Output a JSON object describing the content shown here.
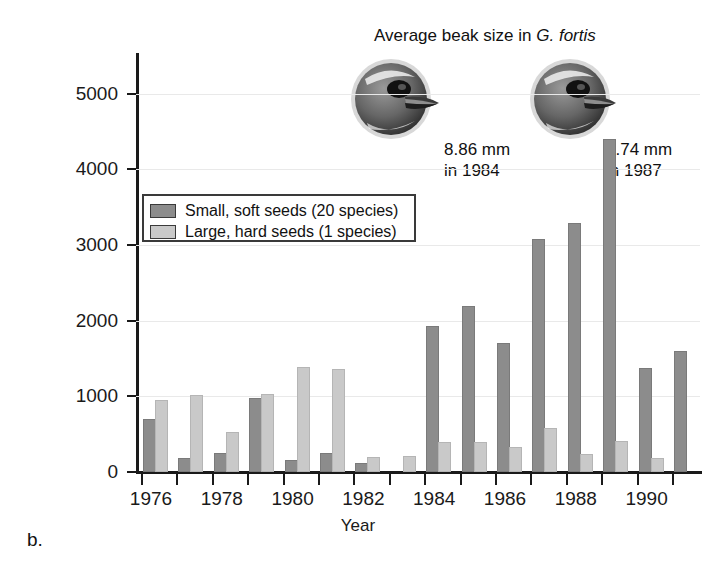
{
  "panel_label": "b.",
  "legend": {
    "items": [
      {
        "key": "small",
        "label": "Small, soft seeds (20 species)",
        "color": "#8c8c8c"
      },
      {
        "key": "large",
        "label": "Large, hard seeds (1 species)",
        "color": "#c9c9c9"
      }
    ]
  },
  "annotation": {
    "title_prefix": "Average beak size in ",
    "title_species": "G. fortis",
    "birds": [
      {
        "name": "bird-1984",
        "size": "8.86 mm",
        "year_line": "in 1984"
      },
      {
        "name": "bird-1987",
        "size": "8.74 mm",
        "year_line": "in 1987"
      }
    ]
  },
  "chart_data": {
    "type": "bar",
    "title": "",
    "xlabel": "Year",
    "ylabel": "Seed mass (mg per square meter)",
    "categories": [
      1976,
      1977,
      1978,
      1979,
      1980,
      1981,
      1982,
      1983,
      1984,
      1985,
      1986,
      1987,
      1988,
      1989,
      1990,
      1991
    ],
    "ylim": [
      0,
      5500
    ],
    "yticks": [
      0,
      1000,
      2000,
      3000,
      4000,
      5000
    ],
    "ytick_labels": [
      "0",
      "1000",
      "2000",
      "3000",
      "4000",
      "5000"
    ],
    "xticks": [
      1976,
      1977,
      1978,
      1979,
      1980,
      1981,
      1982,
      1983,
      1984,
      1985,
      1986,
      1987,
      1988,
      1989,
      1990,
      1991
    ],
    "xtick_labels": [
      "1976",
      "",
      "1978",
      "",
      "1980",
      "",
      "1982",
      "",
      "1984",
      "",
      "1986",
      "",
      "1988",
      "",
      "1990",
      ""
    ],
    "grid": true,
    "legend_position": "upper-left-inset",
    "series": [
      {
        "name": "Small, soft seeds (20 species)",
        "color": "#8c8c8c",
        "values": [
          670,
          160,
          225,
          950,
          130,
          220,
          95,
          0,
          1910,
          2170,
          1680,
          3050,
          3270,
          4370,
          1350,
          1580
        ]
      },
      {
        "name": "Large, hard seeds (1 species)",
        "color": "#c9c9c9",
        "values": [
          930,
          990,
          500,
          1000,
          1360,
          1340,
          175,
          185,
          370,
          370,
          310,
          560,
          215,
          390,
          165,
          0
        ]
      }
    ]
  }
}
